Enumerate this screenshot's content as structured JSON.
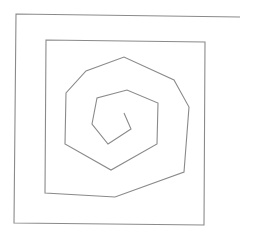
{
  "diagram": {
    "type": "line-drawing",
    "stroke_color": "#8a8a8a",
    "stroke_width": 1.1,
    "background": "#ffffff",
    "spiral_points": [
      [
        240,
        17
      ],
      [
        16,
        14
      ],
      [
        14,
        223
      ],
      [
        204,
        225
      ],
      [
        205,
        42
      ],
      [
        46,
        40
      ],
      [
        45,
        193
      ],
      [
        115,
        197
      ],
      [
        184,
        172
      ],
      [
        189,
        107
      ],
      [
        174,
        80
      ],
      [
        124,
        57
      ],
      [
        86,
        71
      ],
      [
        66,
        93
      ],
      [
        65,
        144
      ],
      [
        111,
        170
      ],
      [
        157,
        144
      ],
      [
        158,
        103
      ],
      [
        127,
        90
      ],
      [
        97,
        98
      ],
      [
        92,
        124
      ],
      [
        108,
        144
      ],
      [
        131,
        129
      ],
      [
        124,
        113
      ]
    ]
  }
}
